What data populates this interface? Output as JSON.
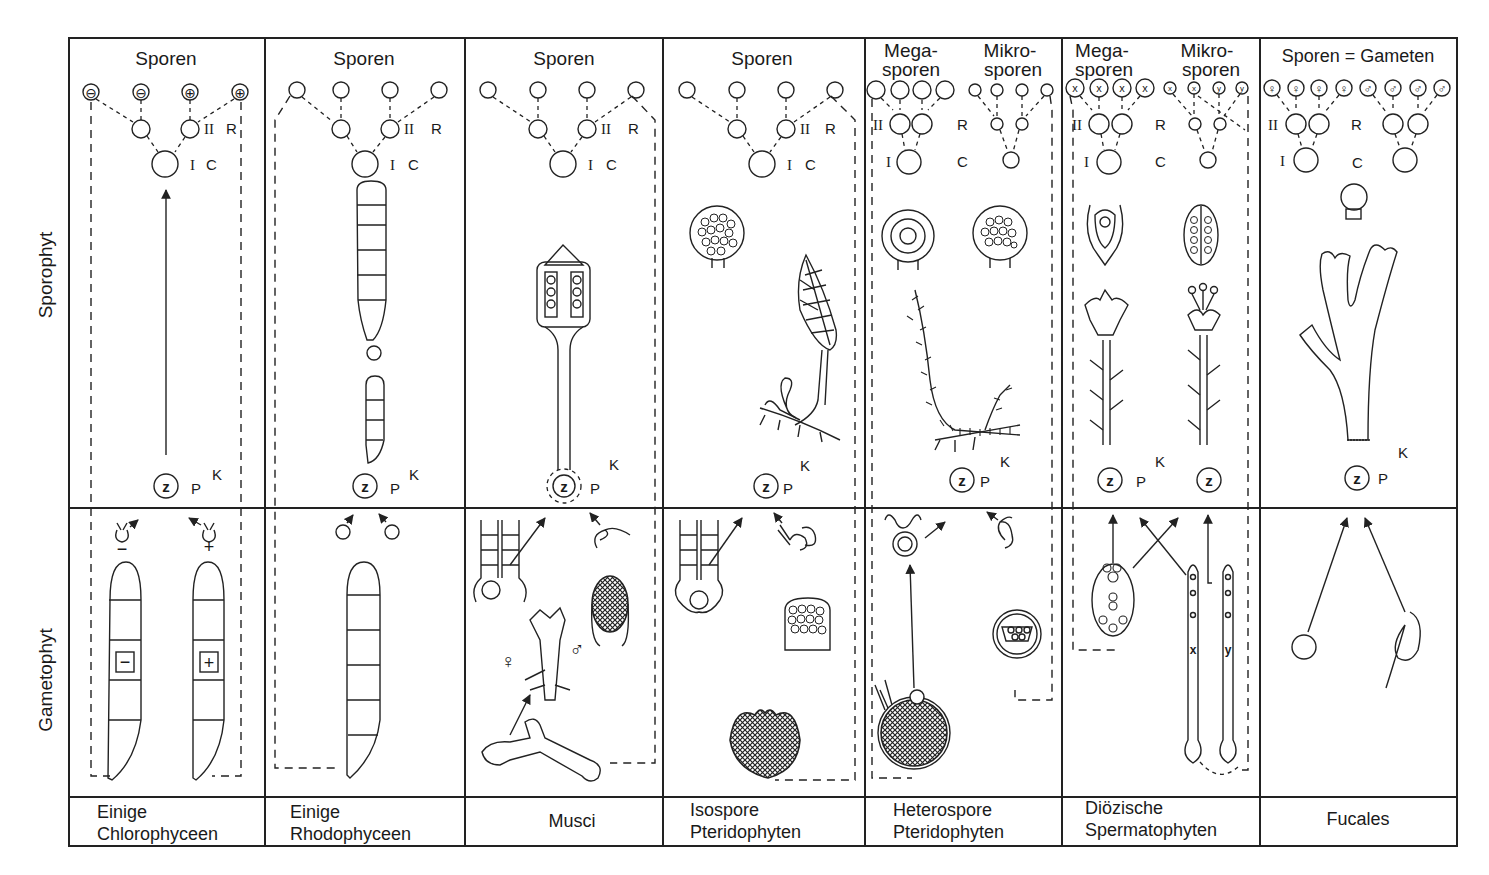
{
  "figure": {
    "row_labels": {
      "sporophyte": "Sporophyt",
      "gametophyte": "Gametophyt"
    },
    "stage_markers": {
      "meiosis_I": "I",
      "meiosis_II": "II",
      "R": "R",
      "C": "C",
      "P": "P",
      "K": "K",
      "zygote": "z"
    },
    "columns": [
      {
        "id": "chlorophyceen",
        "header": "Sporen",
        "footer_line1": "Einige",
        "footer_line2": "Chlorophyceen",
        "spore_marks": [
          "⊖",
          "⊖",
          "⊕",
          "⊕"
        ],
        "gamete_marks": [
          "−",
          "+"
        ]
      },
      {
        "id": "rhodophyceen",
        "header": "Sporen",
        "footer_line1": "Einige",
        "footer_line2": "Rhodophyceen"
      },
      {
        "id": "musci",
        "header": "Sporen",
        "footer_line1": "Musci",
        "footer_line2": "",
        "sex_marks": [
          "♀",
          "♂"
        ]
      },
      {
        "id": "isospore",
        "header": "Sporen",
        "footer_line1": "Isospore",
        "footer_line2": "Pteridophyten"
      },
      {
        "id": "heterospore",
        "header_left_1": "Mega-",
        "header_left_2": "sporen",
        "header_right_1": "Mikro-",
        "header_right_2": "sporen",
        "footer_line1": "Heterospore",
        "footer_line2": "Pteridophyten"
      },
      {
        "id": "spermatophyten",
        "header_left_1": "Mega-",
        "header_left_2": "sporen",
        "header_right_1": "Mikro-",
        "header_right_2": "sporen",
        "footer_line1": "Diözische",
        "footer_line2": "Spermatophyten",
        "mega_marks": [
          "x",
          "x",
          "x",
          "x"
        ],
        "mikro_marks": [
          "x",
          "x",
          "y",
          "y"
        ],
        "chromosome_labels": [
          "x",
          "y"
        ]
      },
      {
        "id": "fucales",
        "header": "Sporen = Gameten",
        "footer_line1": "Fucales",
        "footer_line2": "",
        "female_marks": [
          "♀",
          "♀",
          "♀",
          "♀"
        ],
        "male_marks": [
          "♂",
          "♂",
          "♂",
          "♂"
        ]
      }
    ]
  }
}
